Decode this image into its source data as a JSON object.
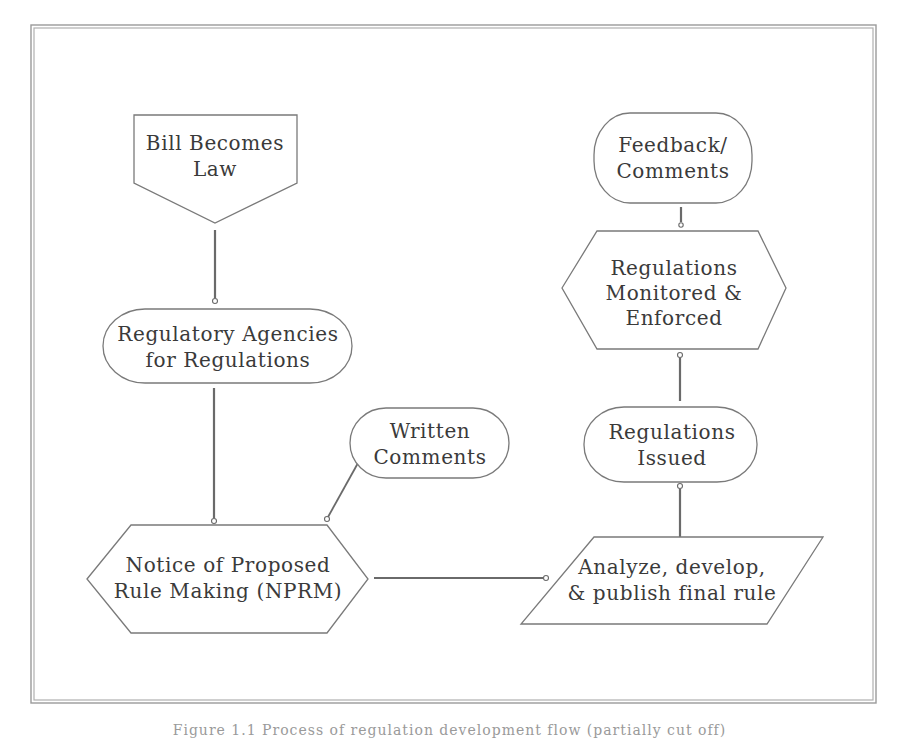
{
  "diagram": {
    "type": "flowchart",
    "nodes": {
      "bill_becomes_law": {
        "shape": "off-page-connector",
        "lines": [
          "Bill Becomes",
          "Law"
        ]
      },
      "regulatory_agencies": {
        "shape": "terminator",
        "lines": [
          "Regulatory Agencies",
          "for Regulations"
        ]
      },
      "nprm": {
        "shape": "hexagon",
        "lines": [
          "Notice of Proposed",
          "Rule Making (NPRM)"
        ]
      },
      "written_comments": {
        "shape": "terminator",
        "lines": [
          "Written",
          "Comments"
        ]
      },
      "analyze_publish": {
        "shape": "parallelogram",
        "lines": [
          "Analyze, develop,",
          "& publish final rule"
        ]
      },
      "regulations_issued": {
        "shape": "terminator",
        "lines": [
          "Regulations",
          "Issued"
        ]
      },
      "monitored_enforced": {
        "shape": "hexagon",
        "lines": [
          "Regulations",
          "Monitored &",
          "Enforced"
        ]
      },
      "feedback_comments": {
        "shape": "terminator",
        "lines": [
          "Feedback/",
          "Comments"
        ]
      }
    },
    "edges": [
      {
        "from": "bill_becomes_law",
        "to": "regulatory_agencies"
      },
      {
        "from": "regulatory_agencies",
        "to": "nprm"
      },
      {
        "from": "written_comments",
        "to": "nprm"
      },
      {
        "from": "nprm",
        "to": "analyze_publish"
      },
      {
        "from": "analyze_publish",
        "to": "regulations_issued"
      },
      {
        "from": "regulations_issued",
        "to": "monitored_enforced"
      },
      {
        "from": "monitored_enforced",
        "to": "feedback_comments"
      }
    ],
    "colors": {
      "stroke": "#7a7a7a",
      "text": "#3a3a3a",
      "background": "#ffffff"
    }
  },
  "caption": {
    "text": "Figure 1.1  Process of regulation development flow (partially cut off)"
  }
}
